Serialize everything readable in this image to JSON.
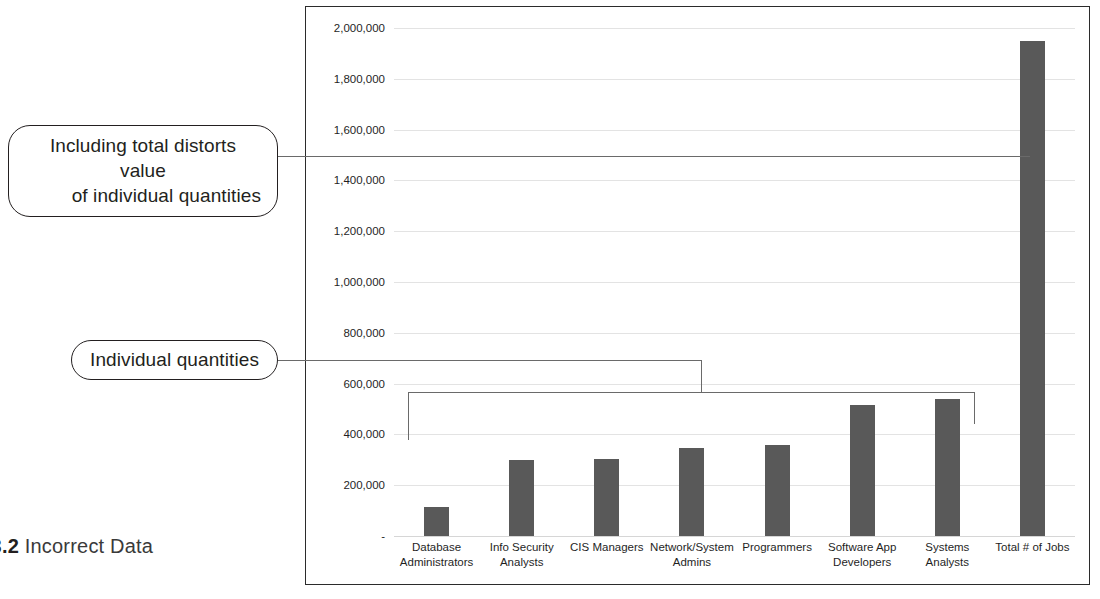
{
  "figure": {
    "label": "URE 3.2",
    "title": "Incorrect Data",
    "subtitle": "rce"
  },
  "callouts": {
    "distort_line1": "Including total distorts value",
    "distort_line2": "of individual quantities",
    "individual": "Individual quantities"
  },
  "chart_data": {
    "type": "bar",
    "title": "",
    "xlabel": "",
    "ylabel": "",
    "ylim": [
      0,
      2000000
    ],
    "grid": true,
    "legend": "none",
    "ytick_labels": [
      "2,000,000",
      "1,800,000",
      "1,600,000",
      "1,400,000",
      "1,200,000",
      "1,000,000",
      "800,000",
      "600,000",
      "400,000",
      "200,000",
      "-"
    ],
    "ytick_values": [
      2000000,
      1800000,
      1600000,
      1400000,
      1200000,
      1000000,
      800000,
      600000,
      400000,
      200000,
      0
    ],
    "categories": [
      "Database Administrators",
      "Info Security Analysts",
      "CIS Managers",
      "Network/System Admins",
      "Programmers",
      "Software App Developers",
      "Systems Analysts",
      "Total # of Jobs"
    ],
    "category_lines": [
      [
        "Database",
        "Administrators"
      ],
      [
        "Info Security",
        "Analysts"
      ],
      [
        "CIS Managers",
        ""
      ],
      [
        "Network/System",
        "Admins"
      ],
      [
        "Programmers",
        ""
      ],
      [
        "Software App",
        "Developers"
      ],
      [
        "Systems",
        "Analysts"
      ],
      [
        "Total # of Jobs",
        ""
      ]
    ],
    "values": [
      115000,
      300000,
      305000,
      345000,
      360000,
      515000,
      540000,
      1950000
    ],
    "bar_color": "#595959"
  },
  "colors": {
    "bar": "#595959",
    "grid": "#e3e3e3",
    "frame": "#2b2b2b",
    "leader": "#6a6a6a",
    "text": "#231f20"
  }
}
